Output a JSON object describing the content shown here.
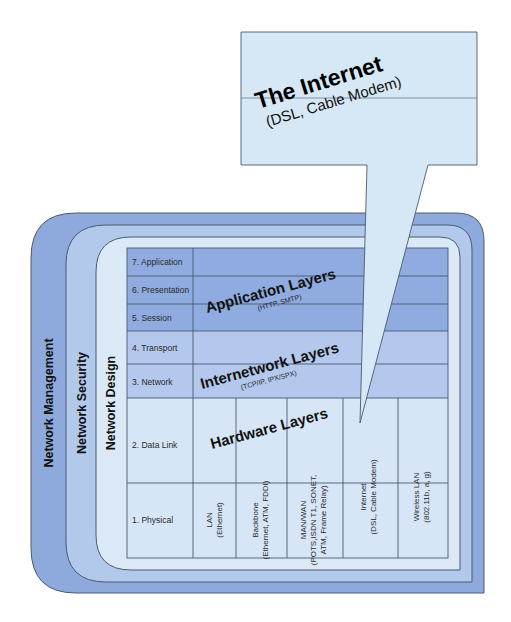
{
  "callout": {
    "title": "The Internet",
    "subtitle": "(DSL, Cable Modem)"
  },
  "rings": {
    "outer": "Network Management",
    "middle": "Network Security",
    "inner": "Network Design"
  },
  "osi_layers": [
    "7. Application",
    "6. Presentation",
    "5. Session",
    "4. Transport",
    "3. Network",
    "2. Data Link",
    "1. Physical"
  ],
  "bands": {
    "application": {
      "title": "Application Layers",
      "subtitle": "(HTTP, SMTP)"
    },
    "internetwork": {
      "title": "Internetwork Layers",
      "subtitle": "(TCP/IP, IPX/SPX)"
    },
    "hardware": {
      "title": "Hardware Layers"
    }
  },
  "hardware_columns": [
    {
      "line1": "LAN",
      "line2": "(Ethernet)",
      "line3": ""
    },
    {
      "line1": "Backbone",
      "line2": "(Ethernet, ATM, FDDI)",
      "line3": ""
    },
    {
      "line1": "MAN/WAN",
      "line2": "(POTS,ISDN T1, SONET,",
      "line3": "ATM, Frame Relay)"
    },
    {
      "line1": "Internet",
      "line2": "(DSL, Cable Modem)",
      "line3": ""
    },
    {
      "line1": "Wireless LAN",
      "line2": "(802.11b, a, g)",
      "line3": ""
    }
  ],
  "colors": {
    "outer_ring": "#8eaadc",
    "middle_ring": "#b3c9ec",
    "inner_ring": "#dbe8f5",
    "application_band": "#8fabe0",
    "internetwork_band": "#b3c8ec",
    "hardware_band": "#d7e6f6",
    "callout": "#d6e8f5",
    "stroke": "#4a5a70"
  }
}
